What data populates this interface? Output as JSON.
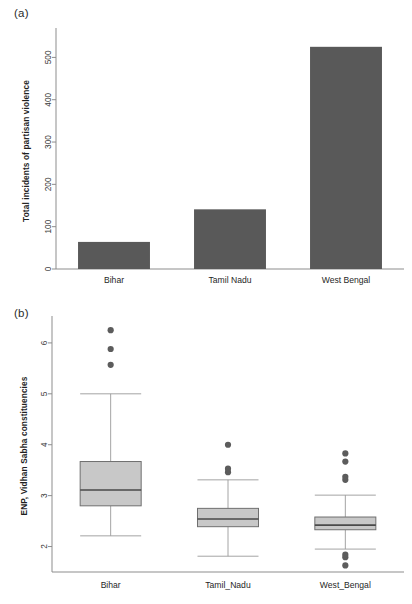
{
  "figure": {
    "panels": [
      {
        "tag": "(a)"
      },
      {
        "tag": "(b)"
      }
    ]
  },
  "colors": {
    "bar_fill": "#595959",
    "box_fill": "#c8c8c8",
    "box_border": "#6f6f6f",
    "median": "#4a4a4a",
    "whisker": "#9a9a9a",
    "outlier": "#5c5c5c",
    "axis": "#8d8d8d",
    "text": "#2b2b2b",
    "background": "#ffffff"
  },
  "chart_data": [
    {
      "type": "bar",
      "panel": "(a)",
      "title": "",
      "xlabel": "",
      "ylabel": "Total incidents of partisan violence",
      "categories": [
        "Bihar",
        "Tamil Nadu",
        "West Bengal"
      ],
      "values": [
        64,
        141,
        525
      ],
      "ylim": [
        0,
        560
      ],
      "yticks": [
        0,
        100,
        200,
        300,
        400,
        500
      ],
      "ytick_labels": [
        "0",
        "100",
        "200",
        "300",
        "400",
        "500"
      ],
      "grid": false,
      "legend": "none",
      "orientation": "vertical"
    },
    {
      "type": "boxplot",
      "panel": "(b)",
      "title": "",
      "xlabel": "",
      "ylabel": "ENP, Vidhan Sabha constituencies",
      "categories": [
        "Bihar",
        "Tamil_Nadu",
        "West_Bengal"
      ],
      "ylim": [
        1.5,
        6.45
      ],
      "yticks": [
        2,
        3,
        4,
        5,
        6
      ],
      "ytick_labels": [
        "2",
        "3",
        "4",
        "5",
        "6"
      ],
      "grid": false,
      "legend": "none",
      "boxes": [
        {
          "name": "Bihar",
          "whisker_low": 2.21,
          "q1": 2.8,
          "median": 3.11,
          "q3": 3.67,
          "whisker_high": 5.0,
          "outliers": [
            5.57,
            5.88,
            6.25
          ]
        },
        {
          "name": "Tamil_Nadu",
          "whisker_low": 1.81,
          "q1": 2.39,
          "median": 2.54,
          "q3": 2.75,
          "whisker_high": 3.31,
          "outliers": [
            3.46,
            3.53,
            4.0
          ]
        },
        {
          "name": "West_Bengal",
          "whisker_low": 1.95,
          "q1": 2.33,
          "median": 2.42,
          "q3": 2.58,
          "whisker_high": 3.01,
          "outliers": [
            1.63,
            1.79,
            1.84,
            3.31,
            3.37,
            3.67,
            3.83
          ]
        }
      ]
    }
  ]
}
